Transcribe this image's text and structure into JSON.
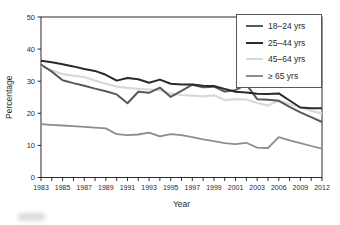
{
  "figure": {
    "ylabel": "Percentage",
    "xlabel": "Year",
    "axis_color": "#2b2b2b",
    "text_color": "#2b2b2b",
    "background": "#ffffff"
  },
  "chart_data": {
    "type": "line",
    "title": "",
    "xlabel": "Year",
    "ylabel": "Percentage",
    "ylim": [
      0,
      50
    ],
    "y_ticks": [
      0,
      10,
      20,
      30,
      40,
      50
    ],
    "n_points": 27,
    "x_tick_labels": [
      "1983",
      "1985",
      "1987",
      "1989",
      "1991",
      "1993",
      "1995",
      "1997",
      "1999",
      "2001",
      "2003",
      "2006",
      "2009",
      "2012"
    ],
    "labeled_tick_indices": [
      0,
      2,
      4,
      6,
      8,
      10,
      12,
      14,
      16,
      18,
      20,
      22,
      24,
      26
    ],
    "grid": false,
    "legend_position": "top-right",
    "draw_order": [
      2,
      3,
      0,
      1
    ],
    "series": [
      {
        "name": "18–24 yrs",
        "color": "#58595b",
        "width": 2,
        "values": [
          35.2,
          33.0,
          30.3,
          29.4,
          28.6,
          27.7,
          26.9,
          25.9,
          23.1,
          26.7,
          26.4,
          28.0,
          25.1,
          27.0,
          28.9,
          28.1,
          28.3,
          26.8,
          27.2,
          29.0,
          24.4,
          24.2,
          23.9,
          22.0,
          20.3,
          18.8,
          17.3
        ]
      },
      {
        "name": "25–44 yrs",
        "color": "#2b2a2a",
        "width": 2,
        "values": [
          36.4,
          35.9,
          35.3,
          34.6,
          33.8,
          33.2,
          32.0,
          30.2,
          31.0,
          30.6,
          29.5,
          30.5,
          29.2,
          29.0,
          29.0,
          28.6,
          28.5,
          27.6,
          26.7,
          26.5,
          26.1,
          26.0,
          26.2,
          24.0,
          21.8,
          21.6,
          21.6
        ]
      },
      {
        "name": "45–64 yrs",
        "color": "#d8d9da",
        "width": 2.2,
        "values": [
          34.6,
          33.4,
          32.2,
          31.7,
          31.3,
          30.2,
          29.2,
          28.3,
          27.9,
          27.6,
          27.4,
          27.2,
          26.1,
          25.7,
          25.5,
          25.3,
          25.6,
          24.1,
          24.4,
          24.3,
          23.2,
          22.4,
          24.0,
          22.9,
          21.8,
          20.8,
          19.9
        ]
      },
      {
        "name": "≥ 65 yrs",
        "color": "#8c8d8f",
        "width": 1.8,
        "values": [
          16.6,
          16.4,
          16.2,
          16.0,
          15.8,
          15.5,
          15.3,
          13.5,
          13.2,
          13.4,
          14.0,
          12.8,
          13.5,
          13.2,
          12.6,
          11.9,
          11.3,
          10.7,
          10.4,
          10.8,
          9.3,
          9.2,
          12.6,
          11.6,
          10.7,
          9.8,
          9.0
        ]
      }
    ]
  }
}
